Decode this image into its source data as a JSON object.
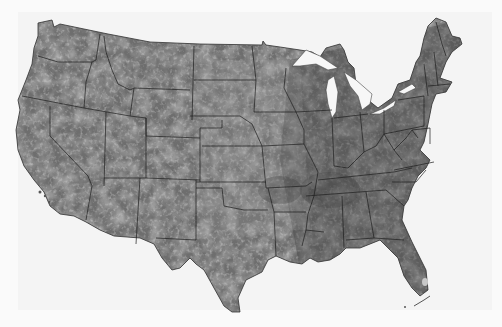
{
  "map": {
    "subject": "Contiguous United States",
    "style": "grayscale raster with state boundaries",
    "colors": {
      "background": "#fafafa",
      "land_base": "#6e6e6e",
      "land_dark": "#4a4a4a",
      "land_light": "#9a9a9a",
      "boundary": "#1e1e1e",
      "water": "#ffffff"
    },
    "features": [
      "state-boundaries",
      "great-lakes",
      "coastline"
    ]
  }
}
